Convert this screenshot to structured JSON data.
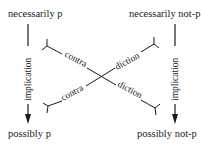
{
  "diagram": {
    "type": "square-of-opposition (modal)",
    "nodes": {
      "top_left": "necessarily p",
      "top_right": "necessarily not-p",
      "bottom_left": "possibly p",
      "bottom_right": "possibly not-p"
    },
    "edges": {
      "left_vertical": "implication",
      "right_vertical": "implication",
      "diagonal_upper_left": "contra",
      "diagonal_upper_right": "diction",
      "diagonal_lower_left": "contra",
      "diagonal_lower_right": "diction"
    },
    "colors": {
      "ink": "#1a1a1a",
      "background": "#ffffff"
    }
  }
}
